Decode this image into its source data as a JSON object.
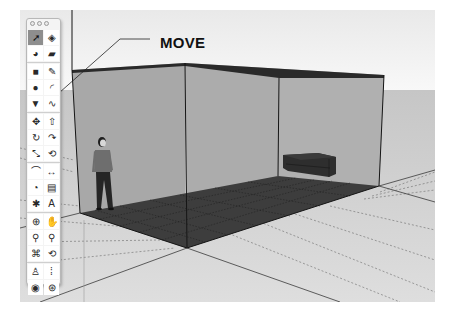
{
  "window": {
    "title_buttons": [
      "close",
      "minimize",
      "zoom"
    ]
  },
  "callout": {
    "label": "MOVE",
    "target_tool": "move"
  },
  "toolbar": {
    "groups": [
      {
        "items": [
          {
            "name": "select",
            "icon": "arrow-cursor-icon",
            "active": true
          },
          {
            "name": "make-component",
            "icon": "component-box-icon",
            "active": false
          },
          {
            "name": "paint-bucket",
            "icon": "paint-bucket-icon",
            "active": false
          },
          {
            "name": "eraser",
            "icon": "eraser-icon",
            "active": false
          }
        ]
      },
      {
        "items": [
          {
            "name": "rectangle",
            "icon": "rectangle-icon",
            "active": false
          },
          {
            "name": "line",
            "icon": "pencil-icon",
            "active": false
          },
          {
            "name": "circle",
            "icon": "circle-icon",
            "active": false
          },
          {
            "name": "arc",
            "icon": "arc-icon",
            "active": false
          },
          {
            "name": "polygon",
            "icon": "polygon-icon",
            "active": false
          },
          {
            "name": "freehand",
            "icon": "freehand-icon",
            "active": false
          }
        ]
      },
      {
        "items": [
          {
            "name": "move",
            "icon": "move-arrows-icon",
            "active": false
          },
          {
            "name": "push-pull",
            "icon": "push-pull-icon",
            "active": false
          },
          {
            "name": "rotate",
            "icon": "rotate-icon",
            "active": false
          },
          {
            "name": "follow-me",
            "icon": "follow-me-icon",
            "active": false
          },
          {
            "name": "scale",
            "icon": "scale-icon",
            "active": false
          },
          {
            "name": "offset",
            "icon": "offset-icon",
            "active": false
          }
        ]
      },
      {
        "items": [
          {
            "name": "tape-measure",
            "icon": "tape-measure-icon",
            "active": false
          },
          {
            "name": "dimension",
            "icon": "dimension-icon",
            "active": false
          },
          {
            "name": "protractor",
            "icon": "protractor-icon",
            "active": false
          },
          {
            "name": "text",
            "icon": "text-label-icon",
            "active": false
          },
          {
            "name": "axes",
            "icon": "axes-icon",
            "active": false
          },
          {
            "name": "3d-text",
            "icon": "3d-text-icon",
            "active": false
          }
        ]
      },
      {
        "items": [
          {
            "name": "orbit",
            "icon": "orbit-icon",
            "active": false
          },
          {
            "name": "pan",
            "icon": "pan-hand-icon",
            "active": false
          },
          {
            "name": "zoom",
            "icon": "zoom-icon",
            "active": false
          },
          {
            "name": "zoom-window",
            "icon": "zoom-window-icon",
            "active": false
          },
          {
            "name": "zoom-extents",
            "icon": "zoom-extents-icon",
            "active": false
          },
          {
            "name": "previous-view",
            "icon": "previous-view-icon",
            "active": false
          }
        ]
      },
      {
        "items": [
          {
            "name": "position-camera",
            "icon": "position-camera-icon",
            "active": false
          },
          {
            "name": "walk",
            "icon": "footprints-icon",
            "active": false
          },
          {
            "name": "look-around",
            "icon": "eye-icon",
            "active": false
          },
          {
            "name": "section-plane",
            "icon": "section-plane-icon",
            "active": false
          }
        ]
      }
    ]
  },
  "scene": {
    "colors": {
      "sky_top": "#eeeeee",
      "sky_bottom": "#f7f7f7",
      "ground": "#cfcfcf",
      "ground_near": "#dadada",
      "wall_back": "#a9a9a9",
      "wall_side": "#a3a3a3",
      "roof_edge": "#2b2b2b",
      "floor": "#3c3c3c",
      "edge": "#1a1a1a",
      "person_shirt": "#6e6e6e",
      "person_pants": "#262626",
      "sofa": "#2e2e2e"
    },
    "objects": [
      "room-box",
      "person-figure",
      "sofa"
    ]
  },
  "glyphs": {
    "select": "➚",
    "make-component": "◈",
    "paint-bucket": "◕",
    "eraser": "▰",
    "rectangle": "■",
    "line": "✎",
    "circle": "●",
    "arc": "◜",
    "polygon": "▼",
    "freehand": "∿",
    "move": "✥",
    "push-pull": "⇧",
    "rotate": "↻",
    "follow-me": "↷",
    "scale": "⤡",
    "offset": "⟲",
    "tape-measure": "⌒",
    "dimension": "↔",
    "protractor": "◔",
    "text": "▤",
    "axes": "✱",
    "3d-text": "A",
    "orbit": "⊕",
    "pan": "✋",
    "zoom": "⚲",
    "zoom-window": "⚲",
    "zoom-extents": "⌘",
    "previous-view": "⟲",
    "position-camera": "♙",
    "walk": "⁞",
    "look-around": "◉",
    "section-plane": "⊛"
  }
}
